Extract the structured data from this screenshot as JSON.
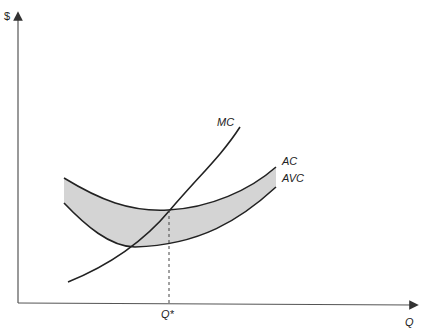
{
  "diagram": {
    "title": "",
    "y_axis_label": "$",
    "x_axis_label": "Q",
    "q_star_label": "Q*",
    "curves": [
      {
        "name": "MC",
        "label": "MC"
      },
      {
        "name": "AC",
        "label": "AC"
      },
      {
        "name": "AVC",
        "label": "AVC"
      }
    ],
    "shaded_region": "Area between AC and AVC (average fixed cost)",
    "colors": {
      "line": "#222222",
      "shade": "#d4d4d4",
      "axis": "#555555"
    }
  }
}
